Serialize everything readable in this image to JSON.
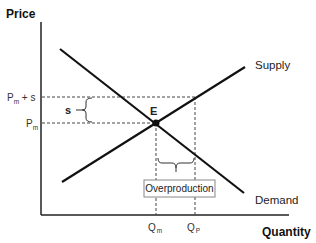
{
  "diagram": {
    "type": "supply-demand",
    "axes": {
      "y_title": "Price",
      "x_title": "Quantity"
    },
    "price_levels": {
      "upper": {
        "main": "P",
        "sub": "m",
        "suffix": " + s"
      },
      "lower": {
        "main": "P",
        "sub": "m"
      }
    },
    "quantity_levels": {
      "left": {
        "main": "Q",
        "sub": "m"
      },
      "right": {
        "main": "Q",
        "sub": "P"
      }
    },
    "curves": {
      "supply": "Supply",
      "demand": "Demand"
    },
    "equilibrium_label": "E",
    "subsidy_label": "s",
    "annotation_box": "Overproduction",
    "colors": {
      "line": "#111111",
      "dashed": "#444444",
      "box_border": "#888888",
      "text": "#222222"
    }
  }
}
